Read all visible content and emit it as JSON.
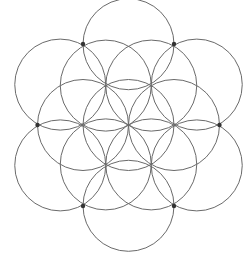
{
  "diagram": {
    "title": "",
    "type": "overlapping-circles",
    "background": "#ffffff",
    "stroke_color": "#6a6a6a",
    "stroke_width": 1,
    "dot_color": "#333333",
    "dot_radius": 2.2,
    "circle_radius": 45.5,
    "center": [
      128.5,
      125
    ],
    "circles": [
      {
        "id": "center",
        "cx": 128.5,
        "cy": 125
      },
      {
        "id": "inner-e",
        "cx": 174,
        "cy": 125
      },
      {
        "id": "inner-w",
        "cx": 83,
        "cy": 125
      },
      {
        "id": "inner-ne",
        "cx": 151.25,
        "cy": 85.6
      },
      {
        "id": "inner-nw",
        "cx": 105.75,
        "cy": 85.6
      },
      {
        "id": "inner-se",
        "cx": 151.25,
        "cy": 164.4
      },
      {
        "id": "inner-sw",
        "cx": 105.75,
        "cy": 164.4
      },
      {
        "id": "outer-n",
        "cx": 128.5,
        "cy": 44.2
      },
      {
        "id": "outer-s",
        "cx": 128.5,
        "cy": 205.8
      },
      {
        "id": "outer-nw",
        "cx": 60.25,
        "cy": 84.6
      },
      {
        "id": "outer-ne",
        "cx": 196.75,
        "cy": 84.6
      },
      {
        "id": "outer-sw",
        "cx": 60.25,
        "cy": 165.4
      },
      {
        "id": "outer-se",
        "cx": 196.75,
        "cy": 165.4
      }
    ],
    "dots": [
      {
        "id": "dot-top-left",
        "x": 83,
        "y": 44
      },
      {
        "id": "dot-top-right",
        "x": 174,
        "y": 44
      },
      {
        "id": "dot-left",
        "x": 37.5,
        "y": 125
      },
      {
        "id": "dot-right",
        "x": 219.5,
        "y": 125
      },
      {
        "id": "dot-bottom-left",
        "x": 83,
        "y": 206
      },
      {
        "id": "dot-bottom-right",
        "x": 174,
        "y": 206
      }
    ]
  }
}
